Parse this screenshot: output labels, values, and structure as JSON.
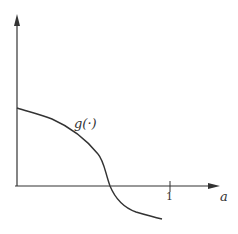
{
  "diagram": {
    "curve_label": "g(·)",
    "x_axis_label": "a",
    "tick_label": "1",
    "colors": {
      "line": "#333333",
      "background": "#ffffff"
    }
  }
}
